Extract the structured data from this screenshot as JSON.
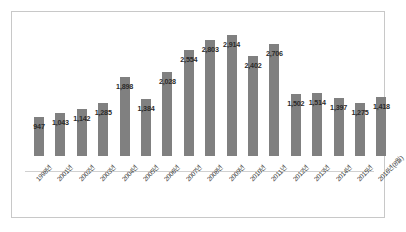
{
  "chart_data": {
    "type": "bar",
    "title": "",
    "subtitle": "",
    "xlabel": "",
    "ylabel": "",
    "grid": false,
    "legend": "none",
    "ylim": [
      0,
      2914
    ],
    "bar_color": "#808080",
    "categories": [
      "1998년",
      "2001년",
      "2002년",
      "2003년",
      "2004년",
      "2005년",
      "2006년",
      "2007년",
      "2008년",
      "2009년",
      "2010년",
      "2011년",
      "2012년",
      "2013년",
      "2014년",
      "2015년",
      "2016년(8월)"
    ],
    "values": [
      947,
      1043,
      1142,
      1285,
      1898,
      1384,
      2028,
      2554,
      2803,
      2914,
      2402,
      2706,
      1502,
      1514,
      1397,
      1275,
      1418
    ],
    "data_labels": [
      "947",
      "1,043",
      "1,142",
      "1,285",
      "1,898",
      "1,384",
      "2,028",
      "2,554",
      "2,803",
      "2,914",
      "2,402",
      "2,706",
      "1,502",
      "1,514",
      "1,397",
      "1,275",
      "1,418"
    ]
  }
}
